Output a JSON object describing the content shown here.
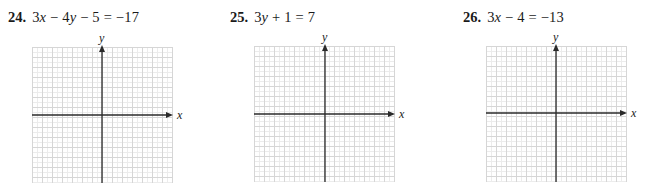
{
  "problems": [
    {
      "number": "24.",
      "equation": "3x − 4y − 5 = −17",
      "equation_parts": [
        "3",
        "x",
        " − 4",
        "y",
        " − 5 = −17"
      ],
      "graph": {
        "x_axis_label": "x",
        "y_axis_label": "y",
        "grid_cells_x": 14,
        "grid_cells_y": 14
      }
    },
    {
      "number": "25.",
      "equation": "3y + 1 = 7",
      "equation_parts": [
        "3",
        "y",
        " + 1 = 7"
      ],
      "graph": {
        "x_axis_label": "x",
        "y_axis_label": "y",
        "grid_cells_x": 14,
        "grid_cells_y": 14
      }
    },
    {
      "number": "26.",
      "equation": "3x − 4 = −13",
      "equation_parts": [
        "3",
        "x",
        " − 4 = −13"
      ],
      "graph": {
        "x_axis_label": "x",
        "y_axis_label": "y",
        "grid_cells_x": 14,
        "grid_cells_y": 14
      }
    }
  ],
  "colors": {
    "grid_major": "#d6d6d6",
    "grid_minor": "#ececec",
    "axis": "#2a2a2a",
    "text": "#1a1a1a"
  }
}
